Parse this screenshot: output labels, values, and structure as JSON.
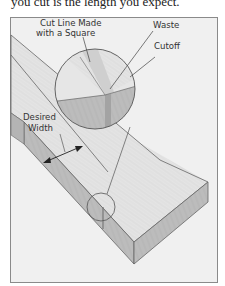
{
  "caption_fragment": "you cut is the length you expect.",
  "figure": {
    "labels": {
      "cut_line_line1": "Cut Line Made",
      "cut_line_line2": "with a Square",
      "waste": "Waste",
      "cutoff": "Cutoff",
      "desired_line1": "Desired",
      "desired_line2": "Width"
    },
    "colors": {
      "frame_bg": "#f0f0f0",
      "frame_border": "#8a8a8a",
      "wood_top": "#e2e2e2",
      "wood_side": "#bdbdbd",
      "kerf": "#a8a8a8",
      "line": "#555555"
    }
  }
}
